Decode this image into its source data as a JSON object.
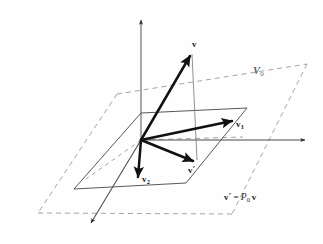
{
  "figure": {
    "background_color": "#fefefe",
    "ink_color": "#1a1a1a",
    "dashed_color": "#8a8a8a",
    "thin_color": "#6f6f6f",
    "labels": {
      "vector_v": "v",
      "vector_v_prime_stem": "v",
      "vector_v_prime_mark": "′",
      "vector_v1_stem": "v",
      "vector_v1_sub": "1",
      "vector_v2_stem": "v",
      "vector_v2_sub": "2",
      "plane_stem": "V",
      "plane_sub": "0",
      "equation_lhs_stem": "v",
      "equation_lhs_mark": "′",
      "equation_operator": "=",
      "equation_matrix": "P",
      "equation_matrix_sub": "0",
      "equation_rhs": "v"
    }
  },
  "geometry": {
    "origin": [
      141,
      140
    ],
    "axes": [
      {
        "name": "vertical-axis",
        "from": [
          141,
          140
        ],
        "to": [
          141,
          17
        ],
        "arrow": true
      },
      {
        "name": "horizontal-axis",
        "from": [
          141,
          140
        ],
        "to": [
          308,
          140
        ],
        "arrow": true
      },
      {
        "name": "depth-axis",
        "from": [
          141,
          140
        ],
        "to": [
          89,
          226
        ],
        "arrow": true
      }
    ],
    "vectors": [
      {
        "name": "v",
        "from": [
          141,
          140
        ],
        "to": [
          192,
          52
        ],
        "label_at": [
          193,
          36
        ]
      },
      {
        "name": "v-prime",
        "from": [
          141,
          140
        ],
        "to": [
          196,
          163
        ],
        "label_at": [
          191,
          166
        ]
      },
      {
        "name": "v1",
        "from": [
          141,
          140
        ],
        "to": [
          233,
          120
        ],
        "label_at": [
          236,
          117
        ]
      },
      {
        "name": "v2",
        "from": [
          141,
          140
        ],
        "to": [
          138,
          180
        ],
        "label_at": [
          142,
          172
        ]
      }
    ],
    "projection_line": {
      "name": "projection-drop-line",
      "from": [
        192,
        52
      ],
      "to": [
        196,
        163
      ]
    },
    "dashed_plane": [
      [
        117,
        94
      ],
      [
        228,
        73
      ],
      [
        307,
        64
      ],
      [
        38,
        213
      ]
    ],
    "solid_plane": [
      [
        141,
        113
      ],
      [
        247,
        108
      ],
      [
        186,
        183
      ],
      [
        74,
        189
      ]
    ],
    "plane_label_at": [
      254,
      67
    ],
    "equation_at": [
      226,
      192
    ]
  }
}
